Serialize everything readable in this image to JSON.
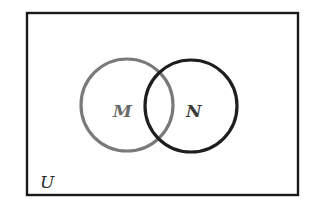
{
  "diagram": {
    "type": "venn",
    "universe": {
      "label": "U",
      "stroke": "#1a1a1a"
    },
    "sets": [
      {
        "id": "M",
        "label": "M",
        "stroke": "#7a7a7a",
        "label_color": "#6a6a6a"
      },
      {
        "id": "N",
        "label": "N",
        "stroke": "#1e1e1e",
        "label_color": "#3a3a3a"
      }
    ],
    "relationship": "M and N overlap (intersecting sets within universal set U)"
  }
}
